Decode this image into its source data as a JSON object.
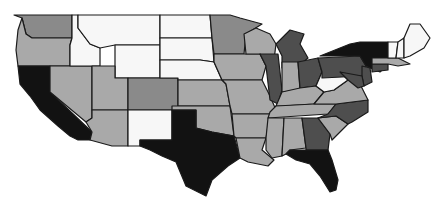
{
  "map": {
    "title": "",
    "type": "choropleth",
    "region": "United States (contiguous)",
    "palette": {
      "white": "#f7f7f7",
      "light": "#a9a9a9",
      "medium": "#8a8a8a",
      "dark": "#4e4e4e",
      "black": "#121212"
    },
    "states": [
      {
        "code": "WA",
        "level": "medium",
        "points": "14,15 72,15 72,38 32,38 26,34 22,18"
      },
      {
        "code": "OR",
        "level": "light",
        "points": "22,18 26,34 32,38 72,38 70,45 70,66 18,66 16,50 18,30"
      },
      {
        "code": "CA",
        "level": "black",
        "points": "18,66 50,66 50,92 92,132 90,140 78,140 70,136 58,126 40,110 30,96 20,84"
      },
      {
        "code": "NV",
        "level": "light",
        "points": "50,66 92,66 92,118 86,122 50,92"
      },
      {
        "code": "ID",
        "level": "white",
        "points": "72,15 78,15 78,28 90,44 100,48 100,66 70,66 70,45 72,38"
      },
      {
        "code": "MT",
        "level": "white",
        "points": "78,15 160,15 160,45 115,45 100,48 90,44 78,28"
      },
      {
        "code": "WY",
        "level": "white",
        "points": "115,45 160,45 160,78 115,78"
      },
      {
        "code": "UT",
        "level": "light",
        "points": "92,66 115,66 115,78 128,78 128,110 92,110"
      },
      {
        "code": "AZ",
        "level": "light",
        "points": "92,110 128,110 128,146 112,146 90,140 92,132 86,122 92,118"
      },
      {
        "code": "CO",
        "level": "medium",
        "points": "128,78 178,78 178,110 128,110"
      },
      {
        "code": "NM",
        "level": "white",
        "points": "128,110 172,110 172,140 140,140 140,146 128,146"
      },
      {
        "code": "ND",
        "level": "white",
        "points": "160,15 210,15 212,38 160,38"
      },
      {
        "code": "SD",
        "level": "white",
        "points": "160,38 212,38 214,62 200,60 160,60"
      },
      {
        "code": "NE",
        "level": "white",
        "points": "160,60 200,60 214,62 222,80 178,80 178,78 160,78"
      },
      {
        "code": "KS",
        "level": "light",
        "points": "178,80 222,80 226,84 230,106 178,106"
      },
      {
        "code": "OK",
        "level": "light",
        "points": "172,106 230,106 234,136 212,132 196,128 196,110 172,110"
      },
      {
        "code": "TX",
        "level": "black",
        "points": "172,110 196,110 196,128 212,132 234,136 240,158 228,166 212,180 206,196 186,186 176,162 162,156 150,150 140,146 140,140 172,140"
      },
      {
        "code": "MN",
        "level": "medium",
        "points": "210,15 230,15 240,18 262,24 246,34 244,54 214,54 212,38"
      },
      {
        "code": "IA",
        "level": "light",
        "points": "214,54 260,54 266,66 262,80 222,80 214,62"
      },
      {
        "code": "MO",
        "level": "light",
        "points": "222,80 262,80 270,96 276,110 270,114 232,114 230,106 226,84"
      },
      {
        "code": "AR",
        "level": "light",
        "points": "232,114 270,114 266,138 236,138 234,136"
      },
      {
        "code": "LA",
        "level": "light",
        "points": "236,138 266,138 262,150 274,160 268,166 248,162 240,158"
      },
      {
        "code": "WI",
        "level": "light",
        "points": "244,34 256,28 270,34 276,44 274,60 260,54 246,54"
      },
      {
        "code": "IL",
        "level": "dark",
        "points": "260,54 278,54 282,90 278,104 270,100 266,66"
      },
      {
        "code": "MI",
        "level": "dark",
        "points": "276,44 290,30 304,34 300,44 308,58 296,68 282,68 282,56"
      },
      {
        "code": "IN",
        "level": "light",
        "points": "282,62 298,62 300,90 282,92"
      },
      {
        "code": "OH",
        "level": "dark",
        "points": "298,62 318,58 322,72 316,86 300,88"
      },
      {
        "code": "KY",
        "level": "light",
        "points": "282,92 300,88 316,86 324,92 314,104 282,106 276,106"
      },
      {
        "code": "TN",
        "level": "light",
        "points": "270,112 276,106 314,104 336,104 328,114 268,118"
      },
      {
        "code": "MS",
        "level": "light",
        "points": "268,118 284,118 282,156 272,158 266,150 266,138"
      },
      {
        "code": "AL",
        "level": "light",
        "points": "284,118 302,118 306,148 290,150 286,154 282,156"
      },
      {
        "code": "GA",
        "level": "dark",
        "points": "302,118 318,118 330,134 328,150 306,150 306,148"
      },
      {
        "code": "FL",
        "level": "black",
        "points": "286,154 290,150 306,150 328,150 332,160 338,180 336,190 330,192 320,176 310,164 296,160"
      },
      {
        "code": "SC",
        "level": "light",
        "points": "318,118 336,116 348,124 332,140 330,134"
      },
      {
        "code": "NC",
        "level": "dark",
        "points": "328,114 336,104 368,100 368,112 352,122 348,124 336,116 318,118"
      },
      {
        "code": "VA",
        "level": "light",
        "points": "314,104 324,92 334,90 348,80 360,84 368,100 336,104"
      },
      {
        "code": "WV",
        "level": "white",
        "points": "316,86 322,72 330,76 340,72 348,80 334,90 324,92"
      },
      {
        "code": "PA",
        "level": "dark",
        "points": "318,58 360,56 366,66 362,76 322,78 322,72"
      },
      {
        "code": "NY",
        "level": "black",
        "points": "320,56 340,48 350,44 360,42 388,42 388,64 380,72 370,68 366,66 360,56"
      },
      {
        "code": "NJ",
        "level": "dark",
        "points": "362,66 370,68 372,82 364,86 362,76"
      },
      {
        "code": "MD",
        "level": "dark",
        "points": "340,72 362,76 364,86 358,88 348,80"
      },
      {
        "code": "CT",
        "level": "dark",
        "points": "372,64 388,64 388,70 372,72"
      },
      {
        "code": "MA",
        "level": "light",
        "points": "372,58 398,58 410,64 398,66 388,64 372,64"
      },
      {
        "code": "VT",
        "level": "white",
        "points": "388,42 398,42 396,58 388,58"
      },
      {
        "code": "NH",
        "level": "white",
        "points": "398,42 404,38 404,58 396,58"
      },
      {
        "code": "ME",
        "level": "white",
        "points": "404,38 410,24 420,24 430,38 424,48 410,56 404,58"
      }
    ]
  }
}
